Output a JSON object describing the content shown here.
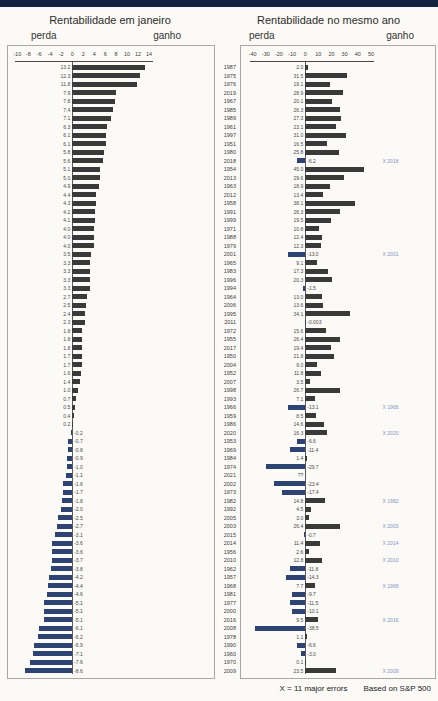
{
  "footer": {
    "note": "X = 11 major errors",
    "source": "Based on S&P 500"
  },
  "colors": {
    "positive_bar": "#3a3a3a",
    "negative_bar": "#2d4374",
    "annotation_blue": "#8293c4",
    "top_bar": "#16233f"
  },
  "chart_data": {
    "type": "bar",
    "orientation": "horizontal",
    "charts": [
      {
        "id": "january",
        "title": "Rentabilidade em janeiro",
        "label_left": "perda",
        "label_right": "ganho",
        "xlim": [
          -10,
          14
        ],
        "ticks": [
          -10,
          -8,
          -6,
          -4,
          -2,
          0,
          2,
          4,
          6,
          8,
          10,
          12,
          14
        ],
        "value_key": "jan",
        "grid": false,
        "shows_years": false
      },
      {
        "id": "full_year",
        "title": "Rentabilidade no mesmo ano",
        "label_left": "perda",
        "label_right": "ganho",
        "xlim": [
          -40,
          50
        ],
        "ticks": [
          -40,
          -30,
          -20,
          -10,
          0,
          10,
          20,
          30,
          40,
          50
        ],
        "value_key": "year_return",
        "grid": false,
        "shows_years": true
      }
    ],
    "rows": [
      {
        "year": "1987",
        "jan": 13.2,
        "year_return": 2.0
      },
      {
        "year": "1975",
        "jan": 12.3,
        "year_return": 31.5
      },
      {
        "year": "1976",
        "jan": 11.8,
        "year_return": 19.1
      },
      {
        "year": "2019",
        "jan": 7.9,
        "year_return": 28.9
      },
      {
        "year": "1967",
        "jan": 7.8,
        "year_return": 20.1
      },
      {
        "year": "1985",
        "jan": 7.4,
        "year_return": 26.3
      },
      {
        "year": "1989",
        "jan": 7.1,
        "year_return": 27.3
      },
      {
        "year": "1961",
        "jan": 6.3,
        "year_return": 23.1
      },
      {
        "year": "1997",
        "jan": 6.1,
        "year_return": 31.0
      },
      {
        "year": "1951",
        "jan": 6.1,
        "year_return": 16.5
      },
      {
        "year": "1980",
        "jan": 5.8,
        "year_return": 25.8
      },
      {
        "year": "2018",
        "jan": 5.6,
        "year_return": -6.2,
        "x_label": "X 2018"
      },
      {
        "year": "1954",
        "jan": 5.1,
        "year_return": 45.0
      },
      {
        "year": "2013",
        "jan": 5.0,
        "year_return": 29.6
      },
      {
        "year": "1963",
        "jan": 4.9,
        "year_return": 18.9
      },
      {
        "year": "2012",
        "jan": 4.4,
        "year_return": 13.4
      },
      {
        "year": "1958",
        "jan": 4.3,
        "year_return": 38.1
      },
      {
        "year": "1991",
        "jan": 4.2,
        "year_return": 26.3
      },
      {
        "year": "1999",
        "jan": 4.1,
        "year_return": 19.5
      },
      {
        "year": "1971",
        "jan": 4.0,
        "year_return": 10.8
      },
      {
        "year": "1988",
        "jan": 4.0,
        "year_return": 12.4
      },
      {
        "year": "1979",
        "jan": 4.0,
        "year_return": 12.3
      },
      {
        "year": "2001",
        "jan": 3.5,
        "year_return": -13.0,
        "x_label": "X 2001"
      },
      {
        "year": "1965",
        "jan": 3.3,
        "year_return": 9.1
      },
      {
        "year": "1983",
        "jan": 3.3,
        "year_return": 17.3
      },
      {
        "year": "1996",
        "jan": 3.3,
        "year_return": 20.3
      },
      {
        "year": "1994",
        "jan": 3.3,
        "year_return": -1.5
      },
      {
        "year": "1964",
        "jan": 2.7,
        "year_return": 13.0
      },
      {
        "year": "2006",
        "jan": 2.5,
        "year_return": 13.6
      },
      {
        "year": "1995",
        "jan": 2.4,
        "year_return": 34.1
      },
      {
        "year": "2011",
        "jan": 2.3,
        "year_return": -0.003,
        "year_return_label": "-0.003"
      },
      {
        "year": "1972",
        "jan": 1.8,
        "year_return": 15.6
      },
      {
        "year": "1955",
        "jan": 1.8,
        "year_return": 26.4
      },
      {
        "year": "2017",
        "jan": 1.8,
        "year_return": 19.4
      },
      {
        "year": "1950",
        "jan": 1.7,
        "year_return": 21.8
      },
      {
        "year": "2004",
        "jan": 1.7,
        "year_return": 9.0
      },
      {
        "year": "1952",
        "jan": 1.6,
        "year_return": 11.8
      },
      {
        "year": "2007",
        "jan": 1.4,
        "year_return": 3.5
      },
      {
        "year": "1998",
        "jan": 1.0,
        "year_return": 26.7
      },
      {
        "year": "1993",
        "jan": 0.7,
        "year_return": 7.1
      },
      {
        "year": "1966",
        "jan": 0.5,
        "year_return": -13.1,
        "x_label": "X 1966"
      },
      {
        "year": "1959",
        "jan": 0.4,
        "year_return": 8.5
      },
      {
        "year": "1986",
        "jan": 0.2,
        "year_return": 14.6
      },
      {
        "year": "2020",
        "jan": -0.2,
        "year_return": 16.3,
        "x_label": "X 2020"
      },
      {
        "year": "1953",
        "jan": -0.7,
        "year_return": -6.6
      },
      {
        "year": "1969",
        "jan": -0.8,
        "year_return": -11.4
      },
      {
        "year": "1984",
        "jan": -0.9,
        "year_return": 1.4
      },
      {
        "year": "1974",
        "jan": -1.0,
        "year_return": -29.7
      },
      {
        "year": "2021",
        "jan": -1.1,
        "year_return": null,
        "year_return_label": "??"
      },
      {
        "year": "2002",
        "jan": -1.6,
        "year_return": -23.4
      },
      {
        "year": "1973",
        "jan": -1.7,
        "year_return": -17.4
      },
      {
        "year": "1982",
        "jan": -1.8,
        "year_return": 14.8,
        "x_label": "X 1982"
      },
      {
        "year": "1992",
        "jan": -2.0,
        "year_return": 4.5
      },
      {
        "year": "2005",
        "jan": -2.5,
        "year_return": 3.0
      },
      {
        "year": "2003",
        "jan": -2.7,
        "year_return": 26.4,
        "x_label": "X 2003"
      },
      {
        "year": "2015",
        "jan": -3.1,
        "year_return": -0.7
      },
      {
        "year": "2014",
        "jan": -3.6,
        "year_return": 11.4,
        "x_label": "X 2014"
      },
      {
        "year": "1956",
        "jan": -3.6,
        "year_return": 2.6
      },
      {
        "year": "2010",
        "jan": -3.7,
        "year_return": 12.8,
        "x_label": "X 2010"
      },
      {
        "year": "1962",
        "jan": -3.8,
        "year_return": -11.8
      },
      {
        "year": "1957",
        "jan": -4.2,
        "year_return": -14.3
      },
      {
        "year": "1968",
        "jan": -4.4,
        "year_return": 7.7,
        "x_label": "X 1968"
      },
      {
        "year": "1981",
        "jan": -4.6,
        "year_return": -9.7
      },
      {
        "year": "1977",
        "jan": -5.1,
        "year_return": -11.5
      },
      {
        "year": "2000",
        "jan": -5.1,
        "year_return": -10.1
      },
      {
        "year": "2016",
        "jan": -5.1,
        "year_return": 9.5,
        "x_label": "X 2016"
      },
      {
        "year": "2008",
        "jan": -6.1,
        "year_return": -38.5
      },
      {
        "year": "1978",
        "jan": -6.2,
        "year_return": 1.1
      },
      {
        "year": "1990",
        "jan": -6.9,
        "year_return": -6.6
      },
      {
        "year": "1960",
        "jan": -7.1,
        "year_return": -3.0
      },
      {
        "year": "1970",
        "jan": -7.6,
        "year_return": 0.1
      },
      {
        "year": "2009",
        "jan": -8.6,
        "year_return": 23.5,
        "x_label": "X 2009"
      }
    ]
  }
}
